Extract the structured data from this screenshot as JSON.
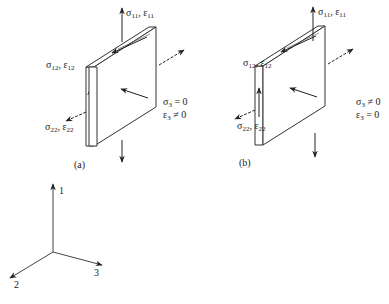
{
  "panels": [
    {
      "id": "a",
      "caption": "(a)",
      "labels": {
        "normal_1": {
          "sym1": "σ",
          "sub1": "11",
          "sep": ", ",
          "sym2": "ε",
          "sub2": "11"
        },
        "shear_12": {
          "sym1": "σ",
          "sub1": "12",
          "sep": ", ",
          "sym2": "ε",
          "sub2": "12"
        },
        "normal_2": {
          "sym1": "σ",
          "sub1": "22",
          "sep": ", ",
          "sym2": "ε",
          "sub2": "22"
        },
        "cond_stress": {
          "sym": "σ",
          "sub": "3",
          "rel": " = 0"
        },
        "cond_strain": {
          "sym": "ε",
          "sub": "3",
          "rel": " ≠ 0"
        }
      }
    },
    {
      "id": "b",
      "caption": "(b)",
      "labels": {
        "normal_1": {
          "sym1": "σ",
          "sub1": "11",
          "sep": ", ",
          "sym2": "ε",
          "sub2": "11"
        },
        "shear_12": {
          "sym1": "σ",
          "sub1": "12",
          "sep": ", ",
          "sym2": "ε",
          "sub2": "12"
        },
        "normal_2": {
          "sym1": "σ",
          "sub1": "22",
          "sep": ", ",
          "sym2": "ε",
          "sub2": "22"
        },
        "cond_stress": {
          "sym": "σ",
          "sub": "3",
          "rel": " ≠ 0"
        },
        "cond_strain": {
          "sym": "ε",
          "sub": "3",
          "rel": " = 0"
        }
      }
    }
  ],
  "axes": {
    "axis_1": "1",
    "axis_2": "2",
    "axis_3": "3"
  },
  "colors": {
    "line": "#333333",
    "arrow": "#222222",
    "background": "#ffffff"
  }
}
